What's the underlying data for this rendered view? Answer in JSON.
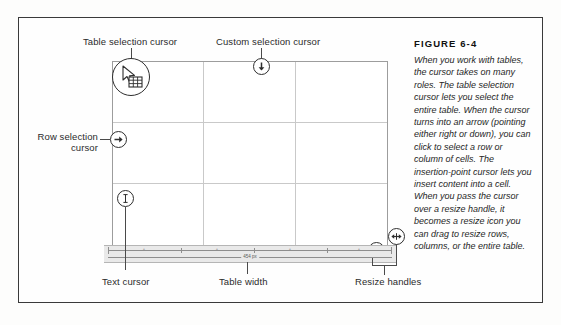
{
  "figure": {
    "title": "FIGURE 6-4",
    "body": "When you work with tables, the cursor takes on many roles. The table selection cursor lets you select the entire table. When the cursor turns into an arrow (pointing either right or down), you can click to select a row or column of cells. The insertion-point cursor lets you insert content into a cell. When you pass the cursor over a resize handle, it becomes a resize icon you can drag to resize rows, columns, or the entire table."
  },
  "callouts": {
    "table_selection": "Table selection cursor",
    "custom_selection": "Custom selection cursor",
    "row_selection_line1": "Row selection",
    "row_selection_line2": "cursor",
    "text_cursor": "Text cursor",
    "table_width": "Table width",
    "resize_handles": "Resize handles"
  },
  "ruler": {
    "width_readout": "454 px",
    "segment_labels": [
      "+",
      "+",
      "+",
      "+"
    ]
  },
  "icons": {
    "table_selection_cursor": "arrow-grid-cursor-icon",
    "custom_selection_cursor": "arrow-down-cursor-icon",
    "row_selection_cursor": "arrow-right-cursor-icon",
    "text_cursor": "i-beam-cursor-icon",
    "resize_vertical": "resize-vertical-icon",
    "resize_horizontal": "resize-horizontal-icon"
  },
  "colors": {
    "frame": "#3a3a3a",
    "grid_line": "#c9c9c9",
    "grid_border": "#9d9d9d",
    "leader": "#4a4a4a",
    "text": "#2b2b2b",
    "ruler_band": "#e9e9e9"
  }
}
